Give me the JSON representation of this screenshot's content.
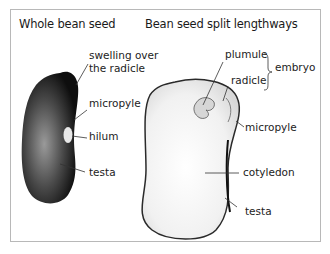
{
  "titles": {
    "whole": "Whole bean seed",
    "split": "Bean seed split lengthways"
  },
  "whole_seed_labels": {
    "swelling_line1": "swelling over",
    "swelling_line2": "the radicle",
    "micropyle": "micropyle",
    "hilum": "hilum",
    "testa": "testa"
  },
  "split_seed_labels": {
    "plumule": "plumule",
    "radicle": "radicle",
    "embryo": "embryo",
    "micropyle": "micropyle",
    "cotyledon": "cotyledon",
    "testa": "testa"
  },
  "colors": {
    "frame_border": "#b8b8b8",
    "whole_seed_dark": "#141414",
    "whole_seed_mid": "#7a7a7a",
    "split_seed_fill": "#f2f2f2",
    "leader_line": "#333333"
  }
}
